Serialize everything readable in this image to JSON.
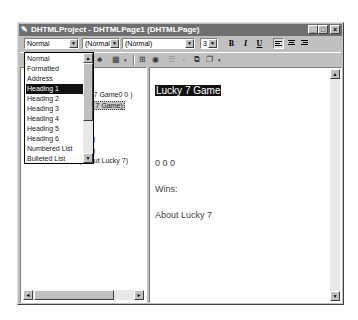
{
  "window": {
    "title": "DHTMLProject - DHTMLPage1 (DHTMLPage)",
    "minimize_label": "_",
    "maximize_label": "□",
    "close_label": "×"
  },
  "format_toolbar": {
    "paragraph_style": "Normal",
    "font_style": "(Normal)",
    "font_name": "(Normal)",
    "font_size": "3",
    "bold_label": "B",
    "italic_label": "I",
    "underline_label": "U",
    "dropdown_arrow": "▼"
  },
  "style_dropdown": {
    "items": [
      {
        "label": "Normal"
      },
      {
        "label": "Formatted"
      },
      {
        "label": "Address"
      },
      {
        "label": "Heading 1"
      },
      {
        "label": "Heading 2"
      },
      {
        "label": "Heading 3"
      },
      {
        "label": "Heading 4"
      },
      {
        "label": "Heading 5"
      },
      {
        "label": "Heading 6"
      },
      {
        "label": "Numbered List"
      },
      {
        "label": "Bulleted List"
      }
    ],
    "selected": "Heading 1",
    "scroll_up": "▲",
    "scroll_down": "▼"
  },
  "tree": {
    "items": [
      {
        "label": "(Lucky 7 Game0 0 )"
      },
      {
        "label": "(Lucky 7 Game)"
      },
      {
        "label": ")"
      },
      {
        "label": ")"
      },
      {
        "label": "(About Lucky 7)"
      }
    ],
    "scroll_left": "◄",
    "scroll_right": "►"
  },
  "document": {
    "heading": "Lucky 7 Game",
    "digits": "0   0   0",
    "wins": "Wins:",
    "about": "About Lucky 7",
    "scroll_up": "▲",
    "scroll_down": "▼"
  }
}
